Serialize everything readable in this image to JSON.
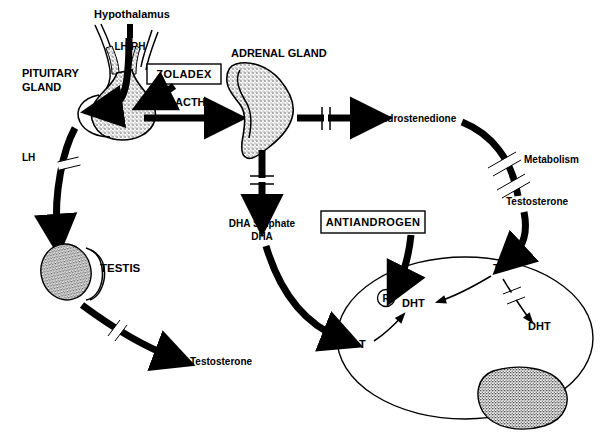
{
  "figure": {
    "background_color": "#ffffff",
    "ink_color": "#000000"
  },
  "labels": {
    "hypothalamus": "Hypothalamus",
    "lhrh": "LH-RH",
    "pituitary_line1": "PITUITARY",
    "pituitary_line2": "GLAND",
    "lh": "LH",
    "testis": "TESTIS",
    "testosterone_testis": "Testosterone",
    "adrenal_gland": "ADRENAL GLAND",
    "acth": "ACTH",
    "androstenedione": "Androstenedione",
    "metabolism": "Metabolism",
    "testosterone_metabolism": "Testosterone",
    "dha_sulphate": "DHA Sulphate",
    "dha": "DHA",
    "cell_t_left": "T",
    "cell_dht_left": "DHT",
    "cell_t_top": "T",
    "cell_dht_right": "DHT",
    "receptor": "R"
  },
  "drug_boxes": [
    {
      "name": "zoladex",
      "label": "ZOLADEX"
    },
    {
      "name": "antiandrogen",
      "label": "ANTIANDROGEN"
    }
  ],
  "organs": [
    {
      "name": "pituitary-gland",
      "label": "PITUITARY GLAND"
    },
    {
      "name": "adrenal-gland",
      "label": "ADRENAL GLAND"
    },
    {
      "name": "testis",
      "label": "TESTIS"
    },
    {
      "name": "target-cell",
      "label": "target cell"
    },
    {
      "name": "cell-nucleus",
      "label": "nucleus"
    }
  ],
  "pathways": [
    {
      "name": "lhrh-to-pituitary",
      "from": "Hypothalamus",
      "to": "Pituitary gland",
      "agent": "LH-RH",
      "blocked": false
    },
    {
      "name": "pituitary-to-testis",
      "from": "Pituitary gland",
      "to": "Testis",
      "agent": "LH",
      "blocked": true
    },
    {
      "name": "testis-to-testosterone",
      "from": "Testis",
      "to": "Testosterone",
      "agent": "Testosterone",
      "blocked": true
    },
    {
      "name": "pituitary-to-adrenal",
      "from": "Pituitary gland",
      "to": "Adrenal gland",
      "agent": "ACTH",
      "blocked": false
    },
    {
      "name": "adrenal-to-androstenedione",
      "from": "Adrenal gland",
      "to": "Androstenedione",
      "agent": "Androstenedione",
      "blocked": true
    },
    {
      "name": "adrenal-to-dha",
      "from": "Adrenal gland",
      "to": "DHA Sulphate / DHA",
      "agent": "DHA",
      "blocked": true
    },
    {
      "name": "androstenedione-to-testosterone",
      "from": "Androstenedione",
      "to": "Testosterone",
      "agent": "Metabolism",
      "blocked": false
    },
    {
      "name": "testosterone-into-cell",
      "from": "Testosterone",
      "to": "Target cell",
      "agent": "T",
      "blocked": false
    },
    {
      "name": "dha-into-cell",
      "from": "DHA",
      "to": "Target cell T",
      "agent": "T",
      "blocked": false
    },
    {
      "name": "antiandrogen-to-dht",
      "from": "ANTIANDROGEN",
      "to": "DHT receptor",
      "agent": "antiandrogen",
      "blocked": false
    },
    {
      "name": "cell-t-to-dht-left",
      "from": "T",
      "to": "DHT",
      "agent": "5-alpha-reductase",
      "blocked": false
    },
    {
      "name": "cell-t-to-dht-centre",
      "from": "T",
      "to": "DHT",
      "agent": "",
      "blocked": false
    },
    {
      "name": "cell-t-to-dht-right",
      "from": "T",
      "to": "DHT",
      "agent": "",
      "blocked": true
    }
  ]
}
